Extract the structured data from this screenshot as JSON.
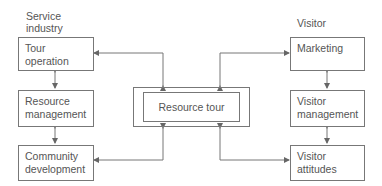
{
  "headers": {
    "left": [
      "Service",
      "industry"
    ],
    "right": [
      "Visitor"
    ]
  },
  "left_boxes": [
    {
      "lines": [
        "Tour",
        "operation"
      ]
    },
    {
      "lines": [
        "Resource",
        "management"
      ]
    },
    {
      "lines": [
        "Community",
        "development"
      ]
    }
  ],
  "right_boxes": [
    {
      "lines": [
        "Marketing"
      ]
    },
    {
      "lines": [
        "Visitor",
        "management"
      ]
    },
    {
      "lines": [
        "Visitor",
        "attitudes"
      ]
    }
  ],
  "center": {
    "label": "Resource tour"
  },
  "colors": {
    "line": "#777777",
    "text": "#555555",
    "background": "#ffffff"
  }
}
